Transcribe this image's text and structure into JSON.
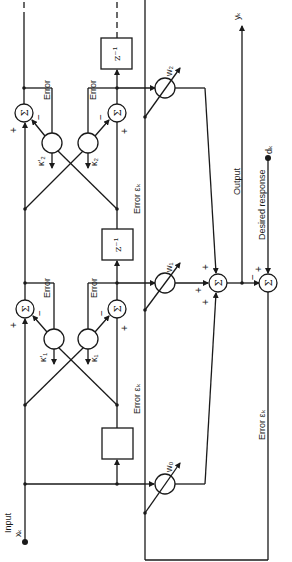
{
  "diagram": {
    "type": "adaptive lattice filter",
    "orientation": "rotated 90 degrees counter-clockwise",
    "input": {
      "label": "Input",
      "symbol": "xₖ"
    },
    "output": {
      "label": "Output",
      "symbol": "yₖ"
    },
    "desired": {
      "label": "Desired response",
      "symbol": "dₖ"
    },
    "error_main": "Error εₖ",
    "delay": "z⁻¹",
    "sum": "Σ",
    "plus": "+",
    "minus": "−",
    "stages": [
      {
        "error_top": "Error",
        "error_bottom": "Error",
        "kappa_prime": "κ′₁",
        "kappa": "κ₁"
      },
      {
        "error_top": "Error",
        "error_bottom": "Error",
        "kappa_prime": "κ′₂",
        "kappa": "κ₂"
      }
    ],
    "weights": [
      "w₀",
      "w₁",
      "w₂"
    ]
  }
}
